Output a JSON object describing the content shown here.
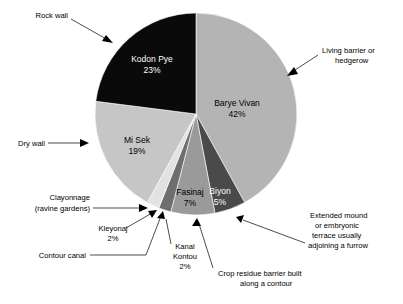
{
  "chart_data": {
    "type": "pie",
    "title": "",
    "subtitle": "",
    "xlabel": "",
    "ylabel": "",
    "legend_position": "none",
    "grid": false,
    "total": 100,
    "units": "%",
    "categories": [
      "Barye Vivan",
      "Biyon",
      "Fasinaj",
      "Kanal Kontou",
      "Kleyonaj",
      "Mi Sek",
      "Kodon Pye"
    ],
    "values": [
      42,
      5,
      7,
      2,
      2,
      19,
      23
    ],
    "slices": [
      {
        "name": "Barye Vivan",
        "label": "Barye Vivan",
        "value": 42,
        "value_label": "42%",
        "color": "#b4b4b4",
        "label_color": "#000000",
        "label_x": 237,
        "label_y": 108
      },
      {
        "name": "Biyon",
        "label": "Biyon",
        "value": 5,
        "value_label": "5%",
        "color": "#4a4a4a",
        "label_color": "#ffffff",
        "label_x": 219,
        "label_y": 194
      },
      {
        "name": "Fasinaj",
        "label": "Fasinaj",
        "value": 7,
        "value_label": "7%",
        "color": "#9a9a9a",
        "label_color": "#000000",
        "label_x": 189,
        "label_y": 196
      },
      {
        "name": "Kanal Kontou",
        "label": "Kanal Kontou",
        "value": 2,
        "value_label": "2%",
        "color": "#6e6e6e",
        "label_color": "#000000",
        "label_x": 0,
        "label_y": 0
      },
      {
        "name": "Kleyonaj",
        "label": "Kleyonaj",
        "value": 2,
        "value_label": "2%",
        "color": "#e2e2e2",
        "label_color": "#000000",
        "label_x": 0,
        "label_y": 0
      },
      {
        "name": "Mi Sek",
        "label": "Mi Sek",
        "value": 19,
        "value_label": "19%",
        "color": "#c6c6c6",
        "label_color": "#000000",
        "label_x": 137,
        "label_y": 145
      },
      {
        "name": "Kodon Pye",
        "label": "Kodon Pye",
        "value": 23,
        "value_label": "23%",
        "color": "#0a0a0a",
        "label_color": "#ffffff",
        "label_x": 152,
        "label_y": 63
      }
    ],
    "annotations": [
      {
        "name": "rock-wall",
        "lines": [
          "Rock wall"
        ],
        "target": "Kodon Pye"
      },
      {
        "name": "living-barrier-or-hedgerow",
        "lines": [
          "Living barrier or",
          "hedgerow"
        ],
        "target": "Barye Vivan"
      },
      {
        "name": "dry-wall",
        "lines": [
          "Dry wall"
        ],
        "target": "Mi Sek"
      },
      {
        "name": "clayonnage-ravine-gardens",
        "lines": [
          "Clayonnage",
          "(ravine gardens)"
        ],
        "target": "Kleyonaj"
      },
      {
        "name": "contour-canal",
        "lines": [
          "Contour canal"
        ],
        "target": "Kanal Kontou"
      },
      {
        "name": "crop-residue-barrier",
        "lines": [
          "Crop residue barrier built",
          "along a contour"
        ],
        "target": "Fasinaj"
      },
      {
        "name": "extended-mound-embryonic-terrace",
        "lines": [
          "Extended mound",
          "or embryonic",
          "terrace usually",
          "adjoining a furrow"
        ],
        "target": "Biyon"
      }
    ]
  },
  "slice_labels": {
    "barye_vivan_name": "Barye Vivan",
    "barye_vivan_pct": "42%",
    "biyon_name": "Biyon",
    "biyon_pct": "5%",
    "fasinaj_name": "Fasinaj",
    "fasinaj_pct": "7%",
    "mi_sek_name": "Mi Sek",
    "mi_sek_pct": "19%",
    "kodon_pye_name": "Kodon Pye",
    "kodon_pye_pct": "23%"
  },
  "outside_labels": {
    "kleyonaj_name": "Kleyonaj",
    "kleyonaj_pct": "2%",
    "kanal_kontou_line1": "Kanal",
    "kanal_kontou_line2": "Kontou",
    "kanal_kontou_pct": "2%"
  },
  "callouts": {
    "rock_wall": "Rock wall",
    "living_barrier_l1": "Living barrier or",
    "living_barrier_l2": "hedgerow",
    "dry_wall": "Dry wall",
    "clayonnage_l1": "Clayonnage",
    "clayonnage_l2": "(ravine gardens)",
    "contour_canal": "Contour canal",
    "crop_residue_l1": "Crop residue barrier built",
    "crop_residue_l2": "along a contour",
    "extended_mound_l1": "Extended mound",
    "extended_mound_l2": "or embryonic",
    "extended_mound_l3": "terrace usually",
    "extended_mound_l4": "adjoining a furrow"
  },
  "colors": {
    "background": "#ffffff",
    "text": "#000000",
    "leader_line": "#000000",
    "barye_vivan": "#b4b4b4",
    "biyon": "#4a4a4a",
    "fasinaj": "#9a9a9a",
    "kanal_kontou": "#6e6e6e",
    "kleyonaj": "#e2e2e2",
    "mi_sek": "#c6c6c6",
    "kodon_pye": "#0a0a0a"
  }
}
